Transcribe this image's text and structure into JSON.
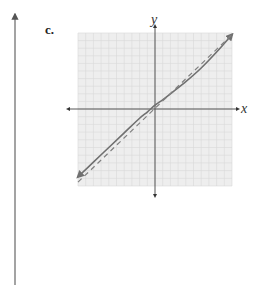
{
  "problem_label": "c.",
  "chart_data": {
    "type": "line",
    "title": "",
    "xlabel": "x",
    "ylabel": "y",
    "xlim": [
      -10,
      10
    ],
    "ylim": [
      -10,
      10
    ],
    "grid": true,
    "grid_step": 1,
    "tick_labels": false,
    "series": [
      {
        "name": "f(x)",
        "style": "solid",
        "arrows": "both",
        "color": "#707070",
        "x": [
          -10,
          -8,
          -6,
          -4,
          -2,
          -1,
          0,
          1,
          2,
          4,
          6,
          8,
          10
        ],
        "y": [
          -8.8,
          -6.9,
          -5.0,
          -3.1,
          -1.2,
          -0.4,
          0.5,
          1.2,
          2.0,
          3.6,
          5.4,
          7.5,
          9.8
        ]
      },
      {
        "name": "y = x",
        "style": "dashed",
        "arrows": "none",
        "color": "#808080",
        "x": [
          -10,
          10
        ],
        "y": [
          -9.5,
          9.8
        ]
      }
    ]
  },
  "colors": {
    "grid_bg": "#eeeeee",
    "grid_minor": "#d8d8d8",
    "axis": "#555555",
    "curve": "#707070",
    "left_arrow": "#666666"
  }
}
